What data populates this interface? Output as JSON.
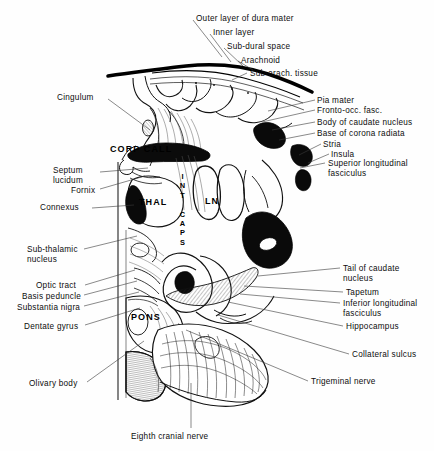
{
  "figure": {
    "background_color": "#fefefe",
    "ink_color": "#0d0d0d"
  },
  "labels_top": [
    {
      "id": "outer-layer-of-dura-mater",
      "text": "Outer layer of dura mater",
      "x": 196,
      "y": 14,
      "align": "left",
      "leader": [
        [
          193,
          20
        ],
        [
          222,
          57
        ]
      ]
    },
    {
      "id": "inner-layer",
      "text": "Inner layer",
      "x": 213,
      "y": 28,
      "align": "left",
      "leader": [
        [
          210,
          34
        ],
        [
          231,
          62
        ]
      ]
    },
    {
      "id": "sub-dural-space",
      "text": "Sub-dural space",
      "x": 227,
      "y": 42,
      "align": "left",
      "leader": [
        [
          224,
          48
        ],
        [
          243,
          66
        ]
      ]
    },
    {
      "id": "arachnoid",
      "text": "Arachnoid",
      "x": 241,
      "y": 56,
      "align": "left",
      "leader": [
        [
          238,
          61
        ],
        [
          253,
          70
        ]
      ]
    },
    {
      "id": "sub-arach-tissue",
      "text": "Sub-arach. tissue",
      "x": 250,
      "y": 69,
      "align": "left",
      "leader": [
        [
          247,
          73
        ],
        [
          232,
          80
        ]
      ]
    }
  ],
  "labels_right": [
    {
      "id": "pia-mater",
      "text": "Pia mater",
      "x": 317,
      "y": 96,
      "align": "left",
      "leader": [
        [
          315,
          100
        ],
        [
          268,
          111
        ]
      ]
    },
    {
      "id": "fronto-occ-fasc",
      "text": "Fronto-occ. fasc.",
      "x": 317,
      "y": 106,
      "align": "left",
      "leader": [
        [
          315,
          110
        ],
        [
          262,
          122
        ]
      ]
    },
    {
      "id": "body-of-caudate-nucleus",
      "text": "Body of caudate nucleus",
      "x": 317,
      "y": 118,
      "align": "left",
      "leader": [
        [
          315,
          122
        ],
        [
          272,
          130
        ]
      ]
    },
    {
      "id": "base-of-corona-radiata",
      "text": "Base of corona radiata",
      "x": 317,
      "y": 129,
      "align": "left",
      "leader": [
        [
          315,
          133
        ],
        [
          279,
          140
        ]
      ]
    },
    {
      "id": "stria",
      "text": "Stria",
      "x": 323,
      "y": 140,
      "align": "left",
      "leader": [
        [
          321,
          144
        ],
        [
          299,
          155
        ]
      ]
    },
    {
      "id": "insula",
      "text": "Insula",
      "x": 331,
      "y": 150,
      "align": "left",
      "leader": [
        [
          329,
          154
        ],
        [
          308,
          163
        ]
      ]
    },
    {
      "id": "superior-longitudinal-fasciculus",
      "text": "Superior longitudinal\nfasciculus",
      "x": 328,
      "y": 159,
      "align": "left",
      "leader": [
        [
          325,
          163
        ],
        [
          300,
          168
        ]
      ]
    },
    {
      "id": "tail-of-caudate-nucleus",
      "text": "Tail of caudate\nnucleus",
      "x": 343,
      "y": 264,
      "align": "left",
      "leader": [
        [
          340,
          268
        ],
        [
          258,
          276
        ]
      ]
    },
    {
      "id": "tapetum",
      "text": "Tapetum",
      "x": 346,
      "y": 288,
      "align": "left",
      "leader": [
        [
          343,
          292
        ],
        [
          244,
          286
        ]
      ]
    },
    {
      "id": "inferior-longitudinal-fasciculus",
      "text": "Inferior longitudinal\nfasciculus",
      "x": 343,
      "y": 299,
      "align": "left",
      "leader": [
        [
          340,
          303
        ],
        [
          240,
          294
        ]
      ]
    },
    {
      "id": "hippocampus",
      "text": "Hippocampus",
      "x": 346,
      "y": 322,
      "align": "left",
      "leader": [
        [
          343,
          326
        ],
        [
          228,
          302
        ]
      ]
    },
    {
      "id": "collateral-sulcus",
      "text": "Collateral sulcus",
      "x": 352,
      "y": 350,
      "align": "left",
      "leader": [
        [
          349,
          354
        ],
        [
          218,
          315
        ]
      ]
    },
    {
      "id": "trigeminal-nerve",
      "text": "Trigeminal nerve",
      "x": 311,
      "y": 377,
      "align": "left",
      "leader": [
        [
          308,
          381
        ],
        [
          186,
          330
        ]
      ]
    }
  ],
  "labels_left": [
    {
      "id": "cingulum",
      "text": "Cingulum",
      "x": 57,
      "y": 93,
      "align": "left",
      "leader": [
        [
          108,
          99
        ],
        [
          150,
          130
        ]
      ]
    },
    {
      "id": "septum-lucidum",
      "text": "Septum\nlucidum",
      "x": 53,
      "y": 166,
      "align": "left",
      "leader": [
        [
          100,
          172
        ],
        [
          148,
          168
        ]
      ]
    },
    {
      "id": "fornix",
      "text": "Fornix",
      "x": 71,
      "y": 186,
      "align": "left",
      "leader": [
        [
          100,
          189
        ],
        [
          145,
          176
        ]
      ]
    },
    {
      "id": "connexus",
      "text": "Connexus",
      "x": 40,
      "y": 203,
      "align": "left",
      "leader": [
        [
          92,
          208
        ],
        [
          134,
          205
        ]
      ]
    },
    {
      "id": "sub-thalamic-nucleus",
      "text": "Sub-thalamic\nnucleus",
      "x": 27,
      "y": 245,
      "align": "left",
      "leader": [
        [
          84,
          249
        ],
        [
          137,
          236
        ]
      ]
    },
    {
      "id": "optic-tract",
      "text": "Optic tract",
      "x": 36,
      "y": 281,
      "align": "left",
      "leader": [
        [
          85,
          285
        ],
        [
          135,
          270
        ]
      ]
    },
    {
      "id": "basis-peduncle",
      "text": "Basis peduncle",
      "x": 22,
      "y": 292,
      "align": "left",
      "leader": [
        [
          84,
          295
        ],
        [
          137,
          281
        ]
      ]
    },
    {
      "id": "substantia-nigra",
      "text": "Substantia nigra",
      "x": 17,
      "y": 303,
      "align": "left",
      "leader": [
        [
          84,
          306
        ],
        [
          139,
          292
        ]
      ]
    },
    {
      "id": "dentate-gyrus",
      "text": "Dentate gyrus",
      "x": 24,
      "y": 322,
      "align": "left",
      "leader": [
        [
          85,
          325
        ],
        [
          140,
          308
        ]
      ]
    },
    {
      "id": "olivary-body",
      "text": "Olivary body",
      "x": 29,
      "y": 379,
      "align": "left",
      "leader": [
        [
          87,
          382
        ],
        [
          144,
          341
        ]
      ]
    }
  ],
  "labels_bottom": [
    {
      "id": "eighth-cranial-nerve",
      "text": "Eighth cranial nerve",
      "x": 131,
      "y": 432,
      "align": "left",
      "leader": [
        [
          191,
          428
        ],
        [
          191,
          383
        ]
      ]
    }
  ],
  "labels_inline": [
    {
      "id": "corp-call",
      "text": "CORP CALL",
      "x": 110,
      "y": 144
    },
    {
      "id": "thal",
      "text": "THAL",
      "x": 139,
      "y": 197
    },
    {
      "id": "pons",
      "text": "PONS",
      "x": 131,
      "y": 312
    },
    {
      "id": "ln",
      "text": "LN",
      "x": 205,
      "y": 196
    }
  ],
  "labels_vertical": [
    {
      "id": "int-caps",
      "text": "INT CAPS",
      "x": 179,
      "y": 172
    }
  ]
}
